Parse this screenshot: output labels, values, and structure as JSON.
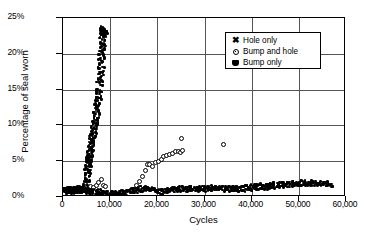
{
  "chart_data": {
    "type": "scatter",
    "title": "",
    "xlabel": "Cycles",
    "ylabel": "Percentage of seal worn",
    "xlim": [
      0,
      60000
    ],
    "ylim": [
      0,
      25
    ],
    "grid": true,
    "legend_position": "top-right",
    "xticks": [
      "0",
      "10,000",
      "20,000",
      "30,000",
      "40,000",
      "50,000",
      "60,000"
    ],
    "xtick_values": [
      0,
      10000,
      20000,
      30000,
      40000,
      50000,
      60000
    ],
    "yticks": [
      "0%",
      "5%",
      "10%",
      "15%",
      "20%",
      "25%"
    ],
    "ytick_values": [
      0,
      5,
      10,
      15,
      20,
      25
    ],
    "series": [
      {
        "name": "Hole only",
        "marker": "x-cross",
        "points": [
          [
            300,
            0.9
          ],
          [
            600,
            0.8
          ],
          [
            900,
            1.0
          ],
          [
            1200,
            0.9
          ],
          [
            1500,
            1.0
          ],
          [
            1800,
            0.8
          ],
          [
            2100,
            1.0
          ],
          [
            2400,
            0.9
          ],
          [
            2700,
            1.1
          ],
          [
            3000,
            0.9
          ],
          [
            3300,
            1.0
          ],
          [
            3600,
            1.1
          ],
          [
            3900,
            0.9
          ],
          [
            4200,
            1.1
          ],
          [
            4500,
            1.0
          ],
          [
            4700,
            1.3
          ],
          [
            4900,
            1.8
          ],
          [
            5000,
            2.4
          ],
          [
            5100,
            3.0
          ],
          [
            5200,
            3.6
          ],
          [
            5300,
            4.1
          ],
          [
            5400,
            4.6
          ],
          [
            5450,
            4.9
          ],
          [
            5500,
            5.2
          ],
          [
            5600,
            5.6
          ],
          [
            5700,
            6.0
          ],
          [
            5800,
            6.4
          ],
          [
            5900,
            6.8
          ],
          [
            6000,
            7.2
          ],
          [
            6100,
            7.6
          ],
          [
            6200,
            8.0
          ],
          [
            6300,
            8.4
          ],
          [
            6400,
            8.8
          ],
          [
            6500,
            9.2
          ],
          [
            6600,
            9.6
          ],
          [
            6700,
            10.0
          ],
          [
            6800,
            10.4
          ],
          [
            6900,
            10.8
          ],
          [
            7000,
            11.3
          ],
          [
            7100,
            11.8
          ],
          [
            7200,
            12.3
          ],
          [
            7300,
            12.8
          ],
          [
            7400,
            13.3
          ],
          [
            7500,
            13.8
          ],
          [
            7600,
            14.4
          ],
          [
            7700,
            15.0
          ],
          [
            7800,
            15.7
          ],
          [
            7900,
            16.4
          ],
          [
            8000,
            17.2
          ],
          [
            8050,
            17.8
          ],
          [
            8100,
            18.4
          ],
          [
            8150,
            19.0
          ],
          [
            8200,
            19.6
          ],
          [
            8250,
            20.2
          ],
          [
            8300,
            20.8
          ],
          [
            8350,
            21.4
          ],
          [
            8400,
            22.0
          ],
          [
            8450,
            22.5
          ],
          [
            8500,
            22.9
          ],
          [
            8550,
            23.2
          ],
          [
            8600,
            23.4
          ],
          [
            8650,
            23.5
          ],
          [
            8700,
            23.3
          ],
          [
            8750,
            23.1
          ]
        ]
      },
      {
        "name": "Bump and hole",
        "marker": "diamond-open",
        "points": [
          [
            5800,
            1.5
          ],
          [
            6400,
            1.3
          ],
          [
            7000,
            1.6
          ],
          [
            7600,
            2.0
          ],
          [
            8200,
            2.4
          ],
          [
            8600,
            1.6
          ],
          [
            9000,
            1.4
          ],
          [
            15500,
            1.6
          ],
          [
            16200,
            2.2
          ],
          [
            16800,
            2.9
          ],
          [
            17400,
            3.7
          ],
          [
            17900,
            4.5
          ],
          [
            18400,
            4.6
          ],
          [
            19000,
            4.3
          ],
          [
            19600,
            4.8
          ],
          [
            20200,
            5.0
          ],
          [
            20800,
            5.3
          ],
          [
            21400,
            5.6
          ],
          [
            22000,
            5.8
          ],
          [
            22600,
            6.0
          ],
          [
            23200,
            6.1
          ],
          [
            23800,
            6.3
          ],
          [
            24400,
            6.4
          ],
          [
            24900,
            6.2
          ],
          [
            25400,
            6.5
          ],
          [
            25200,
            8.2
          ],
          [
            34000,
            7.4
          ]
        ]
      },
      {
        "name": "Bump only",
        "marker": "square-filled",
        "points": [
          [
            200,
            1.0
          ],
          [
            800,
            0.9
          ],
          [
            1400,
            1.1
          ],
          [
            2000,
            0.9
          ],
          [
            2600,
            1.0
          ],
          [
            3200,
            0.9
          ],
          [
            3800,
            1.0
          ],
          [
            4400,
            0.8
          ],
          [
            5000,
            0.9
          ],
          [
            5600,
            0.8
          ],
          [
            6200,
            0.7
          ],
          [
            6800,
            0.8
          ],
          [
            7400,
            0.6
          ],
          [
            8000,
            0.7
          ],
          [
            8600,
            0.6
          ],
          [
            9200,
            0.5
          ],
          [
            9800,
            0.5
          ],
          [
            10400,
            0.4
          ],
          [
            11000,
            0.5
          ],
          [
            11600,
            0.4
          ],
          [
            12200,
            0.5
          ],
          [
            12800,
            0.6
          ],
          [
            13400,
            0.5
          ],
          [
            14000,
            0.7
          ],
          [
            14600,
            0.8
          ],
          [
            15200,
            0.9
          ],
          [
            15800,
            1.0
          ],
          [
            16400,
            1.1
          ],
          [
            17000,
            1.2
          ],
          [
            17600,
            1.3
          ],
          [
            18200,
            1.2
          ],
          [
            18800,
            1.1
          ],
          [
            19400,
            0.9
          ],
          [
            20000,
            0.6
          ],
          [
            20600,
            0.7
          ],
          [
            21200,
            0.8
          ],
          [
            21800,
            0.9
          ],
          [
            22400,
            1.0
          ],
          [
            23000,
            1.0
          ],
          [
            23600,
            1.1
          ],
          [
            24200,
            1.0
          ],
          [
            24800,
            1.1
          ],
          [
            25400,
            1.2
          ],
          [
            26000,
            1.1
          ],
          [
            26600,
            1.2
          ],
          [
            27200,
            1.1
          ],
          [
            27800,
            1.2
          ],
          [
            28400,
            1.1
          ],
          [
            29000,
            1.2
          ],
          [
            29600,
            1.1
          ],
          [
            30200,
            1.2
          ],
          [
            30800,
            1.1
          ],
          [
            31400,
            1.2
          ],
          [
            32000,
            1.3
          ],
          [
            32600,
            1.2
          ],
          [
            33200,
            1.2
          ],
          [
            33800,
            1.1
          ],
          [
            34400,
            1.2
          ],
          [
            35000,
            1.1
          ],
          [
            35600,
            1.2
          ],
          [
            36200,
            1.2
          ],
          [
            36800,
            1.1
          ],
          [
            37400,
            1.2
          ],
          [
            38000,
            1.1
          ],
          [
            38600,
            1.2
          ],
          [
            39200,
            1.3
          ],
          [
            39800,
            1.2
          ],
          [
            40400,
            1.4
          ],
          [
            41000,
            1.3
          ],
          [
            41600,
            1.4
          ],
          [
            42200,
            1.5
          ],
          [
            42800,
            1.4
          ],
          [
            43400,
            1.5
          ],
          [
            44000,
            1.6
          ],
          [
            44600,
            1.5
          ],
          [
            45200,
            1.7
          ],
          [
            45800,
            1.6
          ],
          [
            46400,
            1.7
          ],
          [
            47000,
            1.8
          ],
          [
            47600,
            1.7
          ],
          [
            48200,
            1.8
          ],
          [
            48800,
            1.9
          ],
          [
            49400,
            1.8
          ],
          [
            50000,
            1.9
          ],
          [
            50600,
            2.0
          ],
          [
            51200,
            1.9
          ],
          [
            51800,
            2.0
          ],
          [
            52400,
            1.9
          ],
          [
            53000,
            2.0
          ],
          [
            53600,
            1.9
          ],
          [
            54200,
            1.9
          ],
          [
            54800,
            1.8
          ],
          [
            55400,
            1.9
          ],
          [
            56000,
            1.8
          ],
          [
            56600,
            1.8
          ]
        ]
      }
    ]
  },
  "legend": {
    "items": [
      {
        "label": "Hole only",
        "marker": "x-cross"
      },
      {
        "label": "Bump and hole",
        "marker": "diamond-open"
      },
      {
        "label": "Bump only",
        "marker": "square-filled"
      }
    ]
  }
}
